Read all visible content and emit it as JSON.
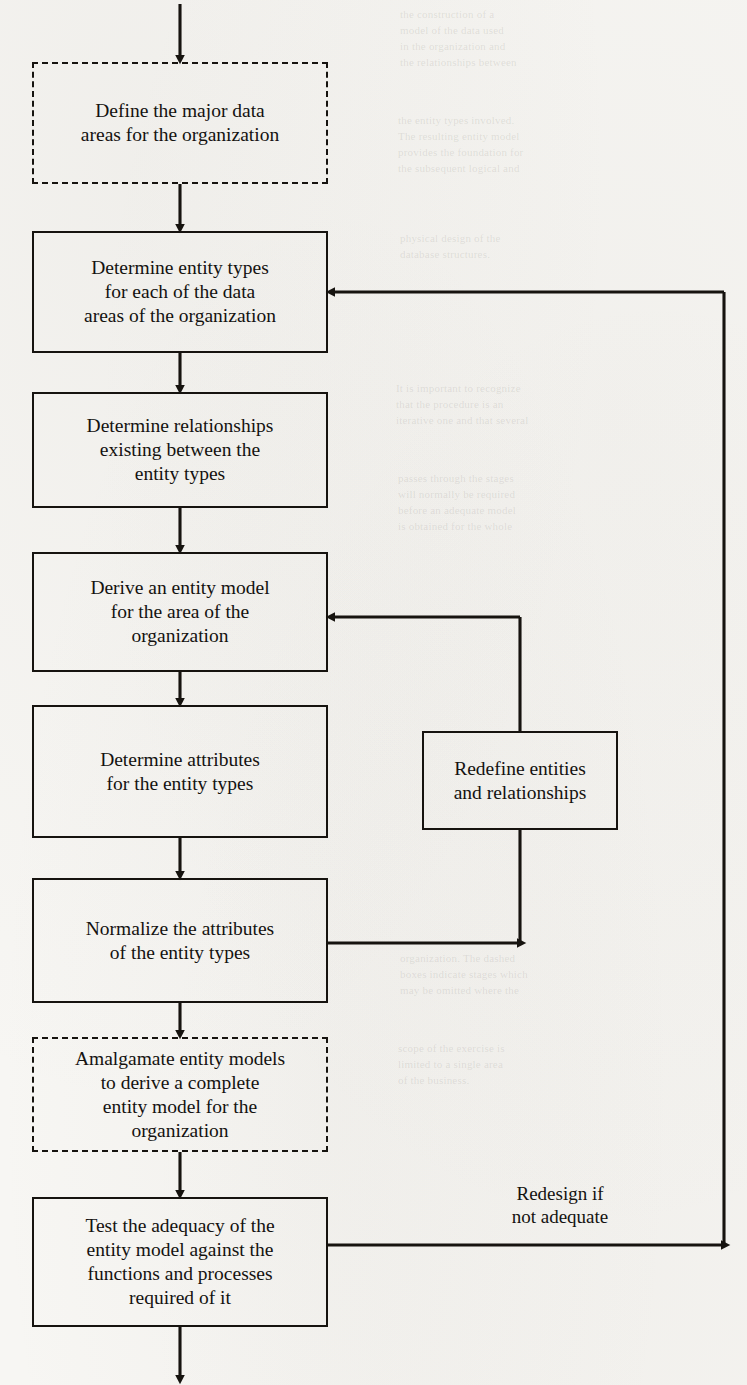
{
  "page": {
    "width": 747,
    "height": 1385,
    "background": "#f7f6f3",
    "ink": "#16130f"
  },
  "diagram": {
    "type": "flowchart",
    "nodes": [
      {
        "id": "define-data-areas",
        "label": "Define the major data\nareas for the organization",
        "style": "dashed",
        "x": 32,
        "y": 62,
        "w": 296,
        "h": 122
      },
      {
        "id": "determine-entity-types",
        "label": "Determine entity types\nfor each of the data\nareas of the organization",
        "style": "solid",
        "x": 32,
        "y": 231,
        "w": 296,
        "h": 122
      },
      {
        "id": "determine-relationships",
        "label": "Determine relationships\nexisting between the\nentity types",
        "style": "solid",
        "x": 32,
        "y": 392,
        "w": 296,
        "h": 116
      },
      {
        "id": "derive-entity-model",
        "label": "Derive an entity model\nfor the area of the\norganization",
        "style": "solid",
        "x": 32,
        "y": 552,
        "w": 296,
        "h": 120
      },
      {
        "id": "determine-attributes",
        "label": "Determine attributes\nfor the entity types",
        "style": "solid",
        "x": 32,
        "y": 705,
        "w": 296,
        "h": 133
      },
      {
        "id": "normalize-attributes",
        "label": "Normalize the attributes\nof the entity types",
        "style": "solid",
        "x": 32,
        "y": 878,
        "w": 296,
        "h": 125
      },
      {
        "id": "amalgamate-entity-models",
        "label": "Amalgamate entity models\nto derive a complete\nentity model for the\norganization",
        "style": "dashed",
        "x": 32,
        "y": 1037,
        "w": 296,
        "h": 115
      },
      {
        "id": "test-adequacy",
        "label": "Test the adequacy of the\nentity model against the\nfunctions and processes\nrequired of it",
        "style": "solid",
        "x": 32,
        "y": 1197,
        "w": 296,
        "h": 130
      },
      {
        "id": "redefine-entities",
        "label": "Redefine entities\nand relationships",
        "style": "solid",
        "x": 422,
        "y": 731,
        "w": 196,
        "h": 99
      }
    ],
    "edge_labels": [
      {
        "id": "redesign-if-not-adequate",
        "text": "Redesign if\nnot adequate",
        "x": 455,
        "y": 1182,
        "w": 210
      }
    ],
    "edges": [
      {
        "id": "entry-arrow",
        "from": "top-of-page",
        "to": "define-data-areas"
      },
      {
        "id": "define-to-determine-types",
        "from": "define-data-areas",
        "to": "determine-entity-types"
      },
      {
        "id": "types-to-relationships",
        "from": "determine-entity-types",
        "to": "determine-relationships"
      },
      {
        "id": "relationships-to-derive",
        "from": "determine-relationships",
        "to": "derive-entity-model"
      },
      {
        "id": "derive-to-attributes",
        "from": "derive-entity-model",
        "to": "determine-attributes"
      },
      {
        "id": "attributes-to-normalize",
        "from": "determine-attributes",
        "to": "normalize-attributes"
      },
      {
        "id": "normalize-to-amalgamate",
        "from": "normalize-attributes",
        "to": "amalgamate-entity-models"
      },
      {
        "id": "amalgamate-to-test",
        "from": "amalgamate-entity-models",
        "to": "test-adequacy"
      },
      {
        "id": "test-to-exit",
        "from": "test-adequacy",
        "to": "bottom-of-page"
      },
      {
        "id": "normalize-to-redefine",
        "from": "normalize-attributes",
        "to": "redefine-entities"
      },
      {
        "id": "redefine-to-derive",
        "from": "redefine-entities",
        "to": "derive-entity-model"
      },
      {
        "id": "test-to-determine-types-feedback",
        "from": "test-adequacy",
        "to": "determine-entity-types"
      }
    ]
  },
  "bleed_through": {
    "blocks": [
      {
        "id": "bleed-top-right",
        "x": 400,
        "y": 6,
        "w": 340,
        "text": "the construction of a\nmodel of the data used\nin the organization and\nthe relationships between"
      },
      {
        "id": "bleed-mid-right-1",
        "x": 398,
        "y": 112,
        "w": 345,
        "text": "the entity types involved.\nThe resulting entity model\nprovides the foundation for\nthe subsequent logical and"
      },
      {
        "id": "bleed-heading-right",
        "x": 400,
        "y": 230,
        "w": 340,
        "text": "physical design of the\ndatabase structures."
      },
      {
        "id": "bleed-mid-right-2",
        "x": 396,
        "y": 380,
        "w": 348,
        "text": "It is important to recognize\nthat the procedure is an\niterative one and that several"
      },
      {
        "id": "bleed-mid-right-3",
        "x": 398,
        "y": 470,
        "w": 344,
        "text": "passes through the stages\nwill normally be required\nbefore an adequate model\nis obtained for the whole"
      },
      {
        "id": "bleed-low-right-1",
        "x": 400,
        "y": 950,
        "w": 342,
        "text": "organization. The dashed\nboxes indicate stages which\nmay be omitted where the"
      },
      {
        "id": "bleed-low-right-2",
        "x": 398,
        "y": 1040,
        "w": 344,
        "text": "scope of the exercise is\nlimited to a single area\nof the business."
      }
    ]
  }
}
